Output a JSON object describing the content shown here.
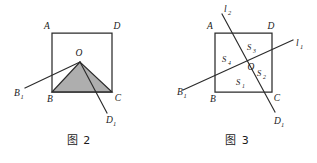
{
  "page": {
    "background_color": "#ffffff",
    "ink_color": "#2b2b2b",
    "shade_color": "#a3a3a3",
    "width": 317,
    "height": 163
  },
  "figures": [
    {
      "id": "figure-2",
      "caption": "图 2",
      "square": {
        "vertices": [
          {
            "name": "A",
            "label": "A",
            "sub": "",
            "x": 52,
            "y": 33
          },
          {
            "name": "D",
            "label": "D",
            "sub": "",
            "x": 112,
            "y": 33
          },
          {
            "name": "C",
            "label": "C",
            "sub": "",
            "x": 112,
            "y": 92
          },
          {
            "name": "B",
            "label": "B",
            "sub": "",
            "x": 52,
            "y": 92
          }
        ]
      },
      "points": [
        {
          "name": "O",
          "label": "O",
          "sub": "",
          "x": 80,
          "y": 62
        },
        {
          "name": "B1",
          "label": "B",
          "sub": "1",
          "x": 25,
          "y": 88
        },
        {
          "name": "D1",
          "label": "D",
          "sub": "1",
          "x": 107,
          "y": 113
        }
      ],
      "rays": [
        {
          "name": "ray-O-B1",
          "from": "O",
          "to": "B1"
        },
        {
          "name": "ray-O-D1",
          "from": "O",
          "to": "D1"
        }
      ],
      "shaded_polygon": {
        "name": "shaded-quadrilateral-OBCD1",
        "points": "80,62 52,92 112,92 80,62"
      },
      "labels": {
        "A": "A",
        "B": "B",
        "C": "C",
        "D": "D",
        "O": "O",
        "B1_base": "B",
        "B1_sub": "1",
        "D1_base": "D",
        "D1_sub": "1"
      }
    },
    {
      "id": "figure-3",
      "caption": "图 3",
      "square": {
        "vertices": [
          {
            "name": "A",
            "label": "A",
            "sub": "",
            "x": 215,
            "y": 33
          },
          {
            "name": "D",
            "label": "D",
            "sub": "",
            "x": 272,
            "y": 33
          },
          {
            "name": "C",
            "label": "C",
            "sub": "",
            "x": 272,
            "y": 92
          },
          {
            "name": "B",
            "label": "B",
            "sub": "",
            "x": 215,
            "y": 92
          }
        ]
      },
      "points": [
        {
          "name": "O",
          "label": "O",
          "sub": "",
          "x": 248,
          "y": 65
        },
        {
          "name": "B1",
          "label": "B",
          "sub": "1",
          "x": 188,
          "y": 87
        },
        {
          "name": "D1",
          "label": "D",
          "sub": "1",
          "x": 277,
          "y": 115
        }
      ],
      "lines": [
        {
          "name": "l1",
          "label": "l",
          "sub": "1",
          "label_x": 297,
          "label_y": 43
        },
        {
          "name": "l2",
          "label": "l",
          "sub": "2",
          "label_x": 226,
          "label_y": 10
        }
      ],
      "regions": [
        {
          "name": "S1",
          "label": "S",
          "sub": "1",
          "x": 238,
          "y": 83
        },
        {
          "name": "S2",
          "label": "S",
          "sub": "2",
          "x": 259,
          "y": 73
        },
        {
          "name": "S3",
          "label": "S",
          "sub": "3",
          "x": 250,
          "y": 48
        },
        {
          "name": "S4",
          "label": "S",
          "sub": "4",
          "x": 225,
          "y": 59
        }
      ],
      "labels": {
        "A": "A",
        "B": "B",
        "C": "C",
        "D": "D",
        "O": "O",
        "B1_base": "B",
        "B1_sub": "1",
        "D1_base": "D",
        "D1_sub": "1",
        "l1_base": "l",
        "l1_sub": "1",
        "l2_base": "l",
        "l2_sub": "2",
        "S1_base": "S",
        "S1_sub": "1",
        "S2_base": "S",
        "S2_sub": "2",
        "S3_base": "S",
        "S3_sub": "3",
        "S4_base": "S",
        "S4_sub": "4"
      }
    }
  ]
}
